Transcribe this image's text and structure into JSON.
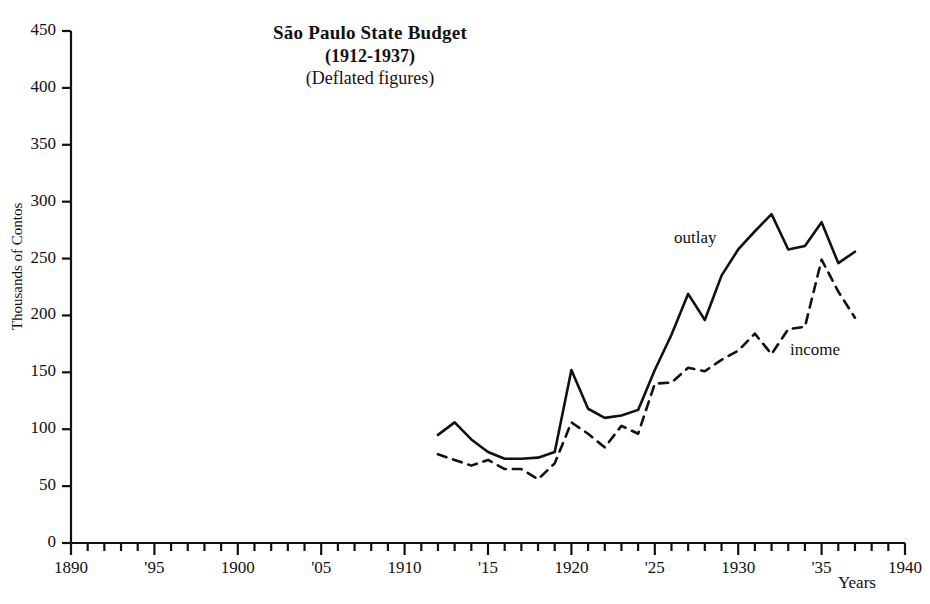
{
  "title": {
    "main": "São Paulo State Budget",
    "years": "(1912-1937)",
    "subtitle": "(Deflated figures)"
  },
  "axes": {
    "ylabel": "Thousands of Contos",
    "xlabel": "Years",
    "y_ticks": [
      "0",
      "50",
      "100",
      "150",
      "200",
      "250",
      "300",
      "350",
      "400",
      "450"
    ],
    "x_ticks": [
      "1890",
      "'95",
      "1900",
      "'05",
      "1910",
      "'15",
      "1920",
      "'25",
      "1930",
      "'35",
      "1940"
    ]
  },
  "legend": {
    "outlay": "outlay",
    "income": "income"
  },
  "colors": {
    "ink": "#111111",
    "background": "#ffffff"
  },
  "chart_data": {
    "type": "line",
    "title": "São Paulo State Budget (1912-1937) (Deflated figures)",
    "xlabel": "Years",
    "ylabel": "Thousands of Contos",
    "xlim": [
      1890,
      1940
    ],
    "ylim": [
      0,
      450
    ],
    "ytick_step": 50,
    "xtick_step": 1,
    "xtick_label_step": 5,
    "grid": false,
    "legend_position": "inline-annotations",
    "x": [
      1912,
      1913,
      1914,
      1915,
      1916,
      1917,
      1918,
      1919,
      1920,
      1921,
      1922,
      1923,
      1924,
      1925,
      1926,
      1927,
      1928,
      1929,
      1930,
      1931,
      1932,
      1933,
      1934,
      1935,
      1936,
      1937
    ],
    "series": [
      {
        "name": "outlay",
        "style": "solid",
        "values": [
          95,
          106,
          91,
          80,
          74,
          74,
          75,
          80,
          152,
          118,
          110,
          112,
          117,
          152,
          183,
          219,
          196,
          235,
          258,
          274,
          289,
          258,
          261,
          282,
          246,
          256
        ]
      },
      {
        "name": "income",
        "style": "dashed",
        "values": [
          78,
          73,
          68,
          73,
          65,
          65,
          56,
          70,
          106,
          96,
          84,
          103,
          96,
          140,
          141,
          154,
          151,
          161,
          169,
          184,
          166,
          188,
          190,
          249,
          221,
          198
        ]
      }
    ]
  }
}
